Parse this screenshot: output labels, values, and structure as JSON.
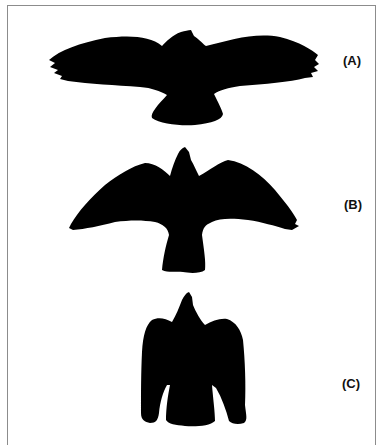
{
  "figure": {
    "panels": [
      {
        "id": "A",
        "label": "(A)",
        "description": "bird silhouette, wings fully spread horizontally"
      },
      {
        "id": "B",
        "label": "(B)",
        "description": "bird silhouette, wings angled downward"
      },
      {
        "id": "C",
        "label": "(C)",
        "description": "bird silhouette, wings folded close to body"
      }
    ],
    "colors": {
      "silhouette": "#000000",
      "frame": "#8c8c8c",
      "background": "#ffffff"
    }
  }
}
